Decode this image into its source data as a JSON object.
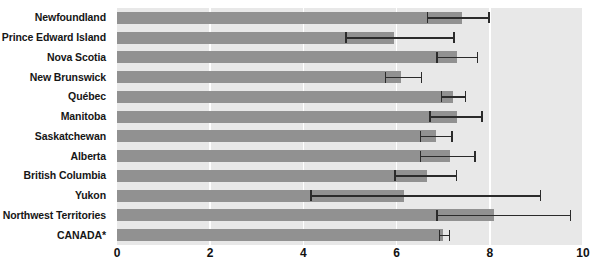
{
  "chart_data": {
    "type": "bar",
    "orientation": "horizontal",
    "title": "",
    "subtitle": "",
    "xlabel": "",
    "ylabel": "",
    "xlim": [
      0,
      10
    ],
    "xticks": [
      0,
      2,
      4,
      6,
      8,
      10
    ],
    "xtick_labels": [
      "0",
      "2",
      "4",
      "6",
      "8",
      "10"
    ],
    "grid": true,
    "grid_axis": "x",
    "legend": false,
    "legend_position": "none",
    "error_bars": true,
    "categories": [
      "Newfoundland",
      "Prince Edward Island",
      "Nova Scotia",
      "New Brunswick",
      "Québec",
      "Manitoba",
      "Saskatchewan",
      "Alberta",
      "British Columbia",
      "Yukon",
      "Northwest Territories",
      "CANADA*"
    ],
    "values": [
      7.4,
      5.95,
      7.3,
      6.1,
      7.2,
      7.3,
      6.85,
      7.15,
      6.65,
      6.15,
      8.1,
      7.0
    ],
    "error_low": [
      6.65,
      4.9,
      6.85,
      5.75,
      6.95,
      6.7,
      6.5,
      6.5,
      5.95,
      4.15,
      6.85,
      6.9
    ],
    "error_high": [
      8.0,
      7.25,
      7.75,
      6.55,
      7.5,
      7.85,
      7.2,
      7.7,
      7.3,
      9.1,
      9.75,
      7.15
    ],
    "colors": {
      "bar": "#919191",
      "error": "#2b2b2b",
      "plot_background": "#e8e8e8",
      "gridline": "#ffffff",
      "text": "#161616",
      "page_background": "#ffffff"
    }
  }
}
